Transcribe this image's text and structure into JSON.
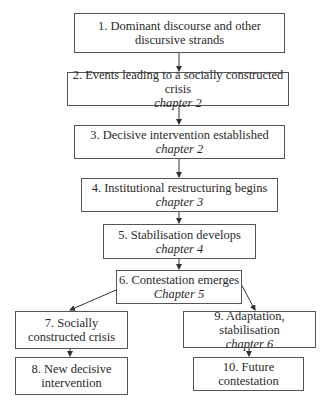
{
  "diagram": {
    "type": "flowchart",
    "nodes": [
      {
        "id": 1,
        "label": "1. Dominant discourse and other discursive strands",
        "line1": "1. Dominant discourse and other",
        "line2": "discursive strands",
        "chapter": ""
      },
      {
        "id": 2,
        "label": "2. Events leading to a socially constructed crisis",
        "line1": "2. Events leading to a socially constructed crisis",
        "chapter": "chapter 2"
      },
      {
        "id": 3,
        "label": "3. Decisive intervention established",
        "line1": "3. Decisive intervention established",
        "chapter": "chapter 2"
      },
      {
        "id": 4,
        "label": "4. Institutional restructuring begins",
        "line1": "4. Institutional restructuring begins",
        "chapter": "chapter 3"
      },
      {
        "id": 5,
        "label": "5. Stabilisation develops",
        "line1": "5. Stabilisation develops",
        "chapter": "chapter 4"
      },
      {
        "id": 6,
        "label": "6. Contestation emerges",
        "line1": "6. Contestation emerges",
        "chapter": "Chapter 5"
      },
      {
        "id": 7,
        "label": "7. Socially constructed crisis",
        "line1": "7. Socially",
        "line2": "constructed crisis",
        "chapter": ""
      },
      {
        "id": 8,
        "label": "8. New decisive intervention",
        "line1": "8. New decisive",
        "line2": "intervention",
        "chapter": ""
      },
      {
        "id": 9,
        "label": "9. Adaptation, stabilisation",
        "line1": "9. Adaptation, stabilisation",
        "chapter": "chapter 6"
      },
      {
        "id": 10,
        "label": "10. Future contestation",
        "line1": "10. Future contestation",
        "chapter": ""
      }
    ],
    "edges": [
      {
        "from": 1,
        "to": 2
      },
      {
        "from": 2,
        "to": 3
      },
      {
        "from": 3,
        "to": 4
      },
      {
        "from": 4,
        "to": 5
      },
      {
        "from": 5,
        "to": 6
      },
      {
        "from": 6,
        "to": 7
      },
      {
        "from": 6,
        "to": 9
      },
      {
        "from": 7,
        "to": 8
      },
      {
        "from": 9,
        "to": 10
      }
    ]
  }
}
